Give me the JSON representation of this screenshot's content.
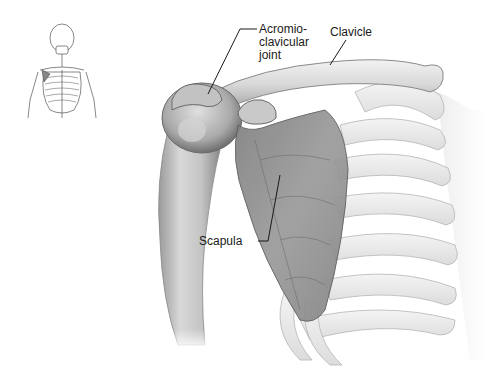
{
  "figure": {
    "labels": {
      "acromioclavicular_joint": [
        "Acromio-",
        "clavicular",
        "joint"
      ],
      "clavicle": "Clavicle",
      "scapula": "Scapula"
    },
    "inset": "Full skeleton thumbnail with shoulder region highlighted",
    "colors": {
      "background": "#ffffff",
      "bone_light": "#e6e6e6",
      "bone_mid": "#bdbdbd",
      "bone_dark": "#7a7a7a",
      "scapula": "#8c8c8c",
      "leader_line": "#1a1a1a",
      "text": "#1a1a1a"
    }
  }
}
